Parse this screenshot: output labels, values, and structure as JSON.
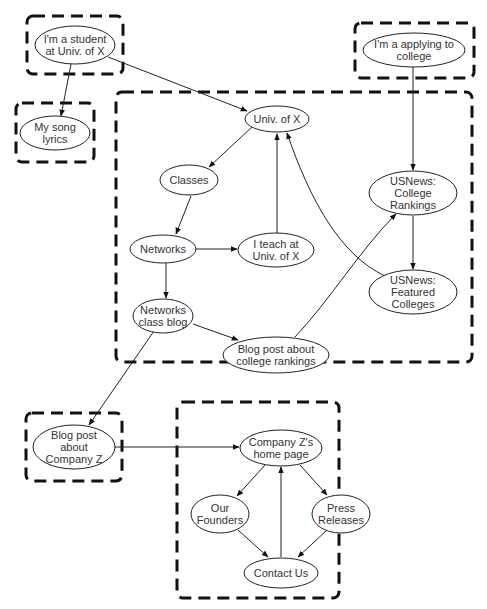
{
  "diagram": {
    "groups": [
      {
        "id": "g_student",
        "x": 27,
        "y": 16,
        "w": 96,
        "h": 58
      },
      {
        "id": "g_song",
        "x": 16,
        "y": 103,
        "w": 78,
        "h": 59
      },
      {
        "id": "g_applying",
        "x": 355,
        "y": 23,
        "w": 119,
        "h": 55
      },
      {
        "id": "g_univ",
        "x": 116,
        "y": 92,
        "w": 356,
        "h": 270
      },
      {
        "id": "g_blogz",
        "x": 26,
        "y": 413,
        "w": 96,
        "h": 68
      },
      {
        "id": "g_company",
        "x": 177,
        "y": 402,
        "w": 162,
        "h": 196
      }
    ],
    "nodes": [
      {
        "id": "student",
        "lines": [
          "I'm a student",
          "at Univ. of X"
        ],
        "cx": 75,
        "cy": 45,
        "rx": 40,
        "ry": 19
      },
      {
        "id": "song",
        "lines": [
          "My song",
          "lyrics"
        ],
        "cx": 55,
        "cy": 133,
        "rx": 35,
        "ry": 17
      },
      {
        "id": "applying",
        "lines": [
          "I'm a applying to",
          "college"
        ],
        "cx": 414,
        "cy": 50,
        "rx": 51,
        "ry": 17
      },
      {
        "id": "univ",
        "lines": [
          "Univ. of X"
        ],
        "cx": 277,
        "cy": 119,
        "rx": 32,
        "ry": 13
      },
      {
        "id": "classes",
        "lines": [
          "Classes"
        ],
        "cx": 189,
        "cy": 180,
        "rx": 29,
        "ry": 15
      },
      {
        "id": "networks",
        "lines": [
          "Networks"
        ],
        "cx": 163,
        "cy": 249,
        "rx": 33,
        "ry": 14
      },
      {
        "id": "teach",
        "lines": [
          "I teach at",
          "Univ. of X"
        ],
        "cx": 276,
        "cy": 250,
        "rx": 38,
        "ry": 17
      },
      {
        "id": "usnews_rank",
        "lines": [
          "USNews:",
          "College",
          "Rankings"
        ],
        "cx": 413,
        "cy": 193,
        "rx": 44,
        "ry": 22
      },
      {
        "id": "usnews_feat",
        "lines": [
          "USNews:",
          "Featured",
          "Colleges"
        ],
        "cx": 413,
        "cy": 292,
        "rx": 44,
        "ry": 22
      },
      {
        "id": "netblog",
        "lines": [
          "Networks",
          "class blog"
        ],
        "cx": 163,
        "cy": 316,
        "rx": 30,
        "ry": 17
      },
      {
        "id": "blogrank",
        "lines": [
          "Blog post about",
          "college rankings"
        ],
        "cx": 276,
        "cy": 355,
        "rx": 53,
        "ry": 18
      },
      {
        "id": "blogz",
        "lines": [
          "Blog post",
          "about",
          "Company Z"
        ],
        "cx": 74,
        "cy": 447,
        "rx": 41,
        "ry": 22
      },
      {
        "id": "zhome",
        "lines": [
          "Company Z's",
          "home page"
        ],
        "cx": 281,
        "cy": 448,
        "rx": 41,
        "ry": 18
      },
      {
        "id": "founders",
        "lines": [
          "Our",
          "Founders"
        ],
        "cx": 220,
        "cy": 514,
        "rx": 29,
        "ry": 19
      },
      {
        "id": "press",
        "lines": [
          "Press",
          "Releases"
        ],
        "cx": 341,
        "cy": 514,
        "rx": 29,
        "ry": 19
      },
      {
        "id": "contact",
        "lines": [
          "Contact Us"
        ],
        "cx": 281,
        "cy": 573,
        "rx": 37,
        "ry": 15
      }
    ],
    "edges": [
      {
        "from": "student",
        "to": "song",
        "d": "M71,64 L61,116"
      },
      {
        "from": "student",
        "to": "univ",
        "d": "M108,57 L247,111"
      },
      {
        "from": "applying",
        "to": "usnews_rank",
        "d": "M413,67 L413,170"
      },
      {
        "from": "univ",
        "to": "classes",
        "d": "M252,127 L209,167"
      },
      {
        "from": "classes",
        "to": "networks",
        "d": "M191,196 L176,234"
      },
      {
        "from": "networks",
        "to": "teach",
        "d": "M196,249 L237,249"
      },
      {
        "from": "networks",
        "to": "netblog",
        "d": "M166,263 L166,298"
      },
      {
        "from": "teach",
        "to": "univ",
        "d": "M277,233 L277,134"
      },
      {
        "from": "usnews_feat",
        "to": "univ",
        "d": "M385,276 C340,255 310,200 287,133"
      },
      {
        "from": "usnews_rank",
        "to": "usnews_feat",
        "d": "M413,216 L413,269"
      },
      {
        "from": "netblog",
        "to": "blogrank",
        "d": "M193,324 L238,340"
      },
      {
        "from": "blogrank",
        "to": "usnews_rank",
        "d": "M295,337 C330,300 360,250 396,214"
      },
      {
        "from": "netblog",
        "to": "blogz",
        "d": "M154,331 L89,425"
      },
      {
        "from": "blogz",
        "to": "zhome",
        "d": "M115,447 L239,447"
      },
      {
        "from": "zhome",
        "to": "founders",
        "d": "M265,465 L237,496"
      },
      {
        "from": "zhome",
        "to": "press",
        "d": "M300,465 L327,495"
      },
      {
        "from": "founders",
        "to": "contact",
        "d": "M238,530 L268,557"
      },
      {
        "from": "press",
        "to": "contact",
        "d": "M327,530 L298,557"
      },
      {
        "from": "contact",
        "to": "zhome",
        "d": "M281,557 L281,467"
      }
    ]
  }
}
